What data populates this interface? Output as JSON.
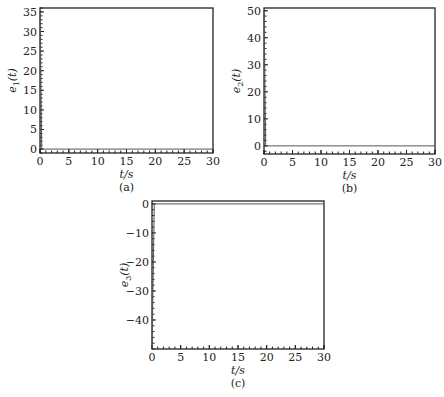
{
  "chart_data": [
    {
      "type": "line",
      "panel": "(a)",
      "xlabel": "t/s",
      "ylabel": "e1(t)",
      "ylabel_main": "e",
      "ylabel_sub": "1",
      "xlim": [
        0,
        30
      ],
      "ylim": [
        -1,
        36
      ],
      "xticks": [
        0,
        5,
        10,
        15,
        20,
        25,
        30
      ],
      "yticks": [
        0,
        5,
        10,
        15,
        20,
        25,
        30,
        35
      ],
      "frame": {
        "x": 40,
        "y": 8,
        "w": 173,
        "h": 145
      },
      "series": [
        {
          "name": "e1(t)",
          "x": [
            0,
            0.3,
            30
          ],
          "values": [
            35,
            0,
            0
          ]
        }
      ]
    },
    {
      "type": "line",
      "panel": "(b)",
      "xlabel": "t/s",
      "ylabel": "e2(t)",
      "ylabel_main": "e",
      "ylabel_sub": "2",
      "xlim": [
        0,
        30
      ],
      "ylim": [
        -3,
        51
      ],
      "xticks": [
        0,
        5,
        10,
        15,
        20,
        25,
        30
      ],
      "yticks": [
        0,
        10,
        20,
        30,
        40,
        50
      ],
      "frame": {
        "x": 264,
        "y": 8,
        "w": 171,
        "h": 146
      },
      "series": [
        {
          "name": "e2(t)",
          "x": [
            0,
            0.3,
            30
          ],
          "values": [
            50,
            0,
            0
          ]
        }
      ]
    },
    {
      "type": "line",
      "panel": "(c)",
      "xlabel": "t/s",
      "ylabel": "e3(t)",
      "ylabel_main": "e",
      "ylabel_sub": "3",
      "xlim": [
        0,
        30
      ],
      "ylim": [
        -50,
        1
      ],
      "xticks": [
        0,
        5,
        10,
        15,
        20,
        25,
        30
      ],
      "yticks": [
        0,
        -10,
        -20,
        -30,
        -40
      ],
      "frame": {
        "x": 152,
        "y": 201,
        "w": 172,
        "h": 148
      },
      "series": [
        {
          "name": "e3(t)",
          "x": [
            0,
            0.4,
            30
          ],
          "values": [
            -50,
            0,
            0
          ]
        }
      ]
    }
  ],
  "captions": [
    "(a)",
    "(b)",
    "(c)"
  ]
}
